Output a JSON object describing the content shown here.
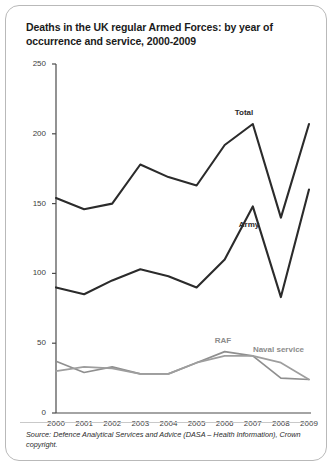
{
  "card": {
    "title": "Deaths in the UK regular Armed Forces: by year of occurrence and service, 2000-2009",
    "source": "Source: Defence Analytical Services and Advice (DASA – Health Information), Crown copyright."
  },
  "chart_data": {
    "type": "line",
    "title": "Deaths in the UK regular Armed Forces: by year of occurrence and service, 2000-2009",
    "xlabel": "",
    "ylabel": "number of deaths",
    "categories": [
      "2000",
      "2001",
      "2002",
      "2003",
      "2004",
      "2005",
      "2006",
      "2007",
      "2008",
      "2009"
    ],
    "x": [
      2000,
      2001,
      2002,
      2003,
      2004,
      2005,
      2006,
      2007,
      2008,
      2009
    ],
    "ylim": [
      0,
      250
    ],
    "yticks": [
      0,
      50,
      100,
      150,
      200,
      250
    ],
    "grid": false,
    "legend": "inline-labels",
    "series": [
      {
        "name": "Total",
        "color": "#2b2b2b",
        "values": [
          154,
          146,
          150,
          178,
          169,
          163,
          192,
          207,
          140,
          207
        ]
      },
      {
        "name": "Army",
        "color": "#2b2b2b",
        "values": [
          90,
          85,
          95,
          103,
          98,
          90,
          110,
          148,
          83,
          160
        ]
      },
      {
        "name": "RAF",
        "color": "#8f8f8f",
        "values": [
          37,
          29,
          33,
          28,
          28,
          36,
          44,
          41,
          25,
          24
        ]
      },
      {
        "name": "Naval service",
        "color": "#9e9e9e",
        "values": [
          30,
          33,
          32,
          28,
          28,
          36,
          41,
          41,
          36,
          24
        ]
      }
    ],
    "annotations": [
      {
        "text": "Total",
        "series": "Total"
      },
      {
        "text": "Army",
        "series": "Army"
      },
      {
        "text": "RAF",
        "series": "RAF"
      },
      {
        "text": "Naval service",
        "series": "Naval service"
      }
    ]
  }
}
